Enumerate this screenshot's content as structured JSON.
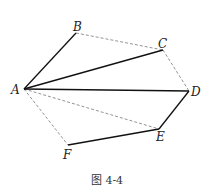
{
  "figure": {
    "caption": "图 4-4",
    "points": {
      "A": {
        "label": "A",
        "x": 24,
        "y": 89
      },
      "B": {
        "label": "B",
        "x": 76,
        "y": 33
      },
      "C": {
        "label": "C",
        "x": 163,
        "y": 50
      },
      "D": {
        "label": "D",
        "x": 189,
        "y": 91
      },
      "E": {
        "label": "E",
        "x": 159,
        "y": 129
      },
      "F": {
        "label": "F",
        "x": 68,
        "y": 145
      }
    },
    "solid_segments": [
      "AB",
      "AC",
      "AD",
      "DE",
      "EF"
    ],
    "dashed_segments": [
      "BC",
      "CD",
      "AE",
      "AF"
    ],
    "colors": {
      "line": "#111111",
      "dashed": "#777777"
    }
  }
}
